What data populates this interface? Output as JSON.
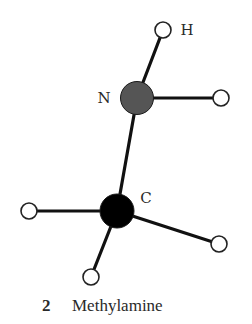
{
  "figure": {
    "number": "2",
    "title": "Methylamine"
  },
  "molecule": {
    "atoms": [
      {
        "id": "N",
        "element": "N",
        "label": "N",
        "cx": 137,
        "cy": 98,
        "r": 16.5,
        "fill": "#555555",
        "label_x": 104,
        "label_y": 98
      },
      {
        "id": "C",
        "element": "C",
        "label": "C",
        "cx": 117,
        "cy": 211,
        "r": 17,
        "fill": "#000000",
        "label_x": 146,
        "label_y": 198
      },
      {
        "id": "H1",
        "element": "H",
        "label": "H",
        "cx": 163,
        "cy": 30,
        "r": 8,
        "fill": "#ffffff",
        "label_x": 187,
        "label_y": 30
      },
      {
        "id": "H2",
        "element": "H",
        "label": "",
        "cx": 221,
        "cy": 98,
        "r": 8,
        "fill": "#ffffff"
      },
      {
        "id": "H3",
        "element": "H",
        "label": "",
        "cx": 29,
        "cy": 211,
        "r": 8,
        "fill": "#ffffff"
      },
      {
        "id": "H4",
        "element": "H",
        "label": "",
        "cx": 91,
        "cy": 277,
        "r": 8,
        "fill": "#ffffff"
      },
      {
        "id": "H5",
        "element": "H",
        "label": "",
        "cx": 219,
        "cy": 244,
        "r": 8,
        "fill": "#ffffff"
      }
    ],
    "bonds": [
      {
        "from": "N",
        "to": "H1"
      },
      {
        "from": "N",
        "to": "H2"
      },
      {
        "from": "N",
        "to": "C"
      },
      {
        "from": "C",
        "to": "H3"
      },
      {
        "from": "C",
        "to": "H4"
      },
      {
        "from": "C",
        "to": "H5"
      }
    ],
    "labels": {
      "N": "N",
      "C": "C",
      "H": "H"
    }
  },
  "colors": {
    "bond": "#111111",
    "nitrogen": "#555555",
    "carbon": "#000000",
    "hydrogen_fill": "#ffffff",
    "hydrogen_stroke": "#222222",
    "text": "#2a2a2a"
  }
}
